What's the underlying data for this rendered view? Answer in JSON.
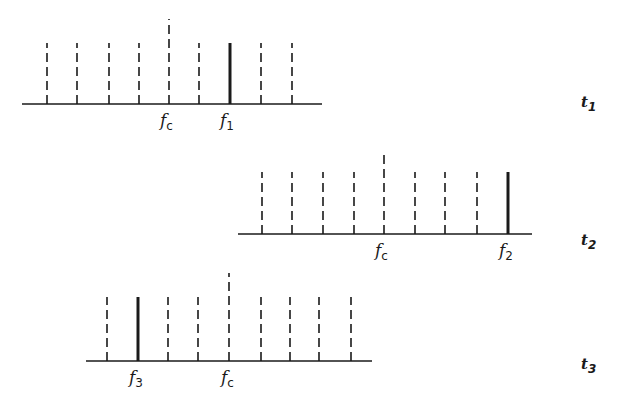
{
  "diagram": {
    "type": "frequency-spectrum-sequence",
    "line_color": "#1a1a1a",
    "panels": [
      {
        "id": "t1",
        "time_label": {
          "base": "t",
          "sub": "1"
        },
        "baseline": {
          "x1": 22,
          "x2": 322,
          "y": 104
        },
        "short_top": 43,
        "tall_top": 19,
        "lines": [
          47,
          77,
          109,
          139,
          169,
          199,
          230,
          261,
          292
        ],
        "carrier_index": 4,
        "active_index": 6,
        "labels": [
          {
            "base": "f",
            "sub": "c",
            "x": 160,
            "role": "carrier"
          },
          {
            "base": "f",
            "sub": "1",
            "x": 220,
            "role": "active"
          }
        ]
      },
      {
        "id": "t2",
        "time_label": {
          "base": "t",
          "sub": "2"
        },
        "baseline": {
          "x1": 238,
          "x2": 532,
          "y": 234
        },
        "short_top": 172,
        "tall_top": 150,
        "lines": [
          262,
          292,
          323,
          354,
          384,
          415,
          445,
          477,
          508
        ],
        "carrier_index": 4,
        "active_index": 8,
        "labels": [
          {
            "base": "f",
            "sub": "c",
            "x": 375,
            "role": "carrier"
          },
          {
            "base": "f",
            "sub": "2",
            "x": 499,
            "role": "active"
          }
        ]
      },
      {
        "id": "t3",
        "time_label": {
          "base": "t",
          "sub": "3"
        },
        "baseline": {
          "x1": 86,
          "x2": 372,
          "y": 361
        },
        "short_top": 297,
        "tall_top": 273,
        "lines": [
          107,
          138,
          168,
          198,
          229,
          261,
          290,
          319,
          351
        ],
        "carrier_index": 4,
        "active_index": 1,
        "labels": [
          {
            "base": "f",
            "sub": "3",
            "x": 129,
            "role": "active"
          },
          {
            "base": "f",
            "sub": "c",
            "x": 221,
            "role": "carrier"
          }
        ]
      }
    ],
    "time_label_x": 581,
    "time_label_y": [
      107,
      245,
      369
    ]
  }
}
